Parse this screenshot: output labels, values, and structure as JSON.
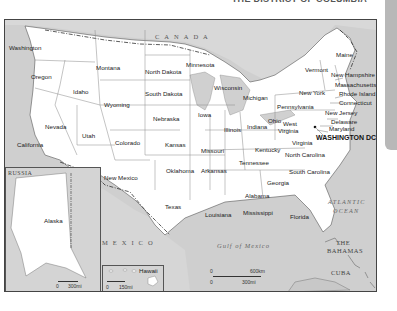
{
  "header": {
    "title": "THE DISTRICT OF COLUMBIA"
  },
  "colors": {
    "land": "#ffffff",
    "water": "#cfcfcf",
    "foreign": "#d6d6d6",
    "border": "#444444",
    "tab": "#b8b8b8"
  },
  "map": {
    "countries": {
      "canada": "CANADA",
      "mexico": "MEXICO",
      "russia": "RUSSIA",
      "cuba": "CUBA",
      "bahamas_line1": "THE",
      "bahamas_line2": "BAHAMAS"
    },
    "water": {
      "gulf": "Gulf of Mexico",
      "atlantic_line1": "ATLANTIC",
      "atlantic_line2": "OCEAN"
    },
    "capital": "WASHINGTON DC",
    "states": {
      "washington": "Washington",
      "oregon": "Oregon",
      "california": "California",
      "idaho": "Idaho",
      "nevada": "Nevada",
      "montana": "Montana",
      "wyoming": "Wyoming",
      "utah": "Utah",
      "colorado": "Colorado",
      "arizona": "Arizona",
      "new_mexico": "New Mexico",
      "north_dakota": "North Dakota",
      "south_dakota": "South Dakota",
      "nebraska": "Nebraska",
      "kansas": "Kansas",
      "oklahoma": "Oklahoma",
      "texas": "Texas",
      "minnesota": "Minnesota",
      "iowa": "Iowa",
      "missouri": "Missouri",
      "arkansas": "Arkansas",
      "louisiana": "Louisiana",
      "wisconsin": "Wisconsin",
      "illinois": "Illinois",
      "michigan": "Michigan",
      "indiana": "Indiana",
      "ohio": "Ohio",
      "kentucky": "Kentucky",
      "tennessee": "Tennessee",
      "mississippi": "Mississippi",
      "alabama": "Alabama",
      "georgia": "Georgia",
      "florida": "Florida",
      "south_carolina": "South Carolina",
      "north_carolina": "North Carolina",
      "virginia": "Virginia",
      "west_virginia_line1": "West",
      "west_virginia_line2": "Virginia",
      "pennsylvania": "Pennsylvania",
      "new_york": "New York",
      "vermont": "Vermont",
      "maine": "Maine",
      "new_hampshire": "New Hampshire",
      "massachusetts": "Massachusetts",
      "rhode_island": "Rhode Island",
      "connecticut": "Connecticut",
      "new_jersey": "New Jersey",
      "delaware": "Delaware",
      "maryland": "Maryland",
      "alaska": "Alaska",
      "hawaii": "Hawaii"
    },
    "scales": {
      "main": {
        "km_start": "0",
        "km_end": "600km",
        "mi_start": "0",
        "mi_end": "300mi"
      },
      "alaska": {
        "start": "0",
        "end": "300mi"
      },
      "hawaii": {
        "start": "0",
        "end": "150mi"
      }
    }
  }
}
